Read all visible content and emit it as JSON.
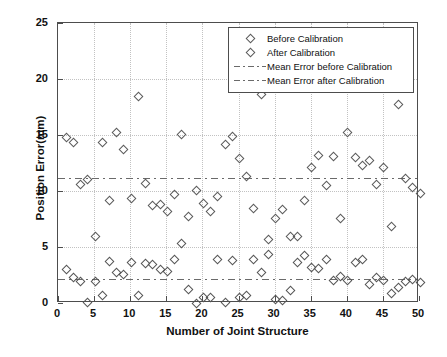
{
  "chart_data": {
    "type": "scatter",
    "title": "",
    "xlabel": "Number of Joint Structure",
    "ylabel": "Position Error(mm)",
    "xlim": [
      0,
      50
    ],
    "ylim": [
      0,
      25
    ],
    "xticks": [
      0,
      5,
      10,
      15,
      20,
      25,
      30,
      35,
      40,
      45,
      50
    ],
    "yticks": [
      0,
      5,
      10,
      15,
      20,
      25
    ],
    "grid": true,
    "legend_position": "upper right",
    "legend": [
      {
        "label": "Before Calibration",
        "marker": "diamond"
      },
      {
        "label": "After Calibration",
        "marker": "diamond"
      },
      {
        "label": "Mean Error before Calibration",
        "marker": "dashdot-line"
      },
      {
        "label": "Mean Error after Calibration",
        "marker": "dashdot-line"
      }
    ],
    "x": [
      1,
      2,
      3,
      4,
      5,
      6,
      7,
      8,
      9,
      10,
      11,
      12,
      13,
      14,
      15,
      16,
      17,
      18,
      19,
      20,
      21,
      22,
      23,
      24,
      25,
      26,
      27,
      28,
      29,
      30,
      31,
      32,
      33,
      34,
      35,
      36,
      37,
      38,
      39,
      40,
      41,
      42,
      43,
      44,
      45,
      46,
      47,
      48,
      49,
      50
    ],
    "series": [
      {
        "name": "Before Calibration",
        "marker": "diamond",
        "values": [
          14.9,
          14.4,
          10.7,
          11.1,
          6.0,
          14.4,
          9.2,
          15.3,
          13.8,
          9.4,
          18.5,
          10.8,
          8.8,
          8.9,
          8.3,
          9.8,
          15.1,
          7.8,
          10.1,
          9.0,
          8.3,
          9.6,
          14.2,
          15.0,
          13.0,
          11.4,
          8.5,
          18.7,
          5.8,
          7.6,
          8.4,
          6.0,
          6.0,
          9.2,
          12.2,
          13.3,
          10.6,
          13.2,
          7.6,
          15.3,
          13.1,
          12.4,
          12.8,
          10.7,
          12.2,
          6.9,
          17.8,
          11.2,
          10.4,
          9.9
        ]
      },
      {
        "name": "After Calibration",
        "marker": "diamond",
        "values": [
          3.1,
          2.4,
          2.0,
          0.15,
          2.0,
          0.8,
          3.8,
          2.8,
          2.6,
          3.7,
          0.75,
          3.6,
          3.5,
          3.1,
          2.9,
          4.0,
          5.4,
          1.3,
          0.05,
          0.55,
          0.6,
          4.0,
          0.1,
          3.9,
          0.6,
          0.75,
          4.0,
          2.8,
          4.4,
          0.4,
          0.35,
          1.2,
          3.7,
          4.3,
          3.3,
          3.2,
          4.0,
          2.1,
          2.5,
          2.1,
          3.7,
          4.0,
          1.7,
          2.4,
          2.1,
          0.9,
          1.5,
          2.0,
          2.2,
          1.9
        ]
      }
    ],
    "mean_lines": [
      {
        "name": "Mean Error before Calibration",
        "value": 11.2,
        "style": "dashdot"
      },
      {
        "name": "Mean Error after Calibration",
        "value": 2.15,
        "style": "dashdot"
      }
    ]
  }
}
